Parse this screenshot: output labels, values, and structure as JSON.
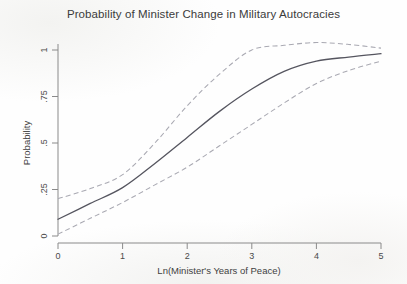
{
  "chart_data": {
    "type": "line",
    "title": "Probability of Minister Change in Military Autocracies",
    "xlabel": "Ln(Minister's Years of Peace)",
    "ylabel": "Probability",
    "xlim": [
      0,
      5
    ],
    "ylim": [
      0,
      1.08
    ],
    "grid": false,
    "legend": "none",
    "xticks": [
      "0",
      "1",
      "2",
      "3",
      "4",
      "5"
    ],
    "xtick_values": [
      0,
      1,
      2,
      3,
      4,
      5
    ],
    "yticks": [
      "0",
      ".25",
      ".5",
      ".75",
      "1"
    ],
    "ytick_values": [
      0,
      0.25,
      0.5,
      0.75,
      1
    ],
    "x": [
      0,
      0.5,
      1,
      1.5,
      2,
      2.5,
      3,
      3.5,
      4,
      4.5,
      5
    ],
    "series": [
      {
        "name": "Upper 95% confidence bound",
        "style": "dashed",
        "color": "#a9a9b2",
        "values": [
          0.2,
          0.255,
          0.33,
          0.5,
          0.7,
          0.87,
          1.0,
          1.025,
          1.04,
          1.03,
          1.01
        ]
      },
      {
        "name": "Predicted probability",
        "style": "solid",
        "color": "#55555f",
        "values": [
          0.09,
          0.175,
          0.26,
          0.39,
          0.53,
          0.67,
          0.79,
          0.885,
          0.94,
          0.962,
          0.98
        ]
      },
      {
        "name": "Lower 95% confidence bound",
        "style": "dashed",
        "color": "#a9a9b2",
        "values": [
          0.01,
          0.095,
          0.18,
          0.275,
          0.37,
          0.485,
          0.6,
          0.715,
          0.82,
          0.89,
          0.94
        ]
      }
    ],
    "annotations": []
  },
  "axes": {
    "y_axis_title": "Probability",
    "x_axis_title": "Ln(Minister's Years of Peace)"
  }
}
